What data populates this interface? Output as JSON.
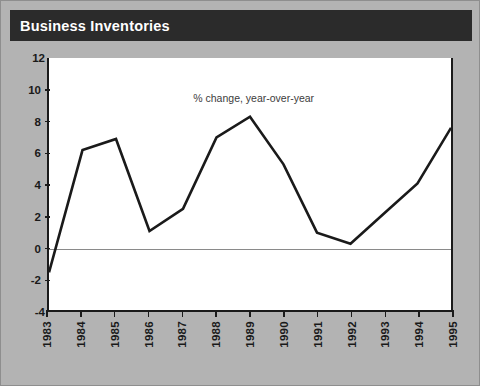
{
  "figure": {
    "background_color": "#b3b3b3",
    "plot_background_color": "#ffffff"
  },
  "header": {
    "title": "Business Inventories",
    "band_color": "#2b2b2b",
    "title_color": "#ffffff"
  },
  "chart_data": {
    "type": "line",
    "title": "Business Inventories",
    "annotation": "% change, year-over-year",
    "xlabel": "",
    "ylabel": "",
    "categories": [
      "1983",
      "1984",
      "1985",
      "1986",
      "1987",
      "1988",
      "1989",
      "1990",
      "1991",
      "1992",
      "1993",
      "1994",
      "1995"
    ],
    "x": [
      1983,
      1984,
      1985,
      1986,
      1987,
      1988,
      1989,
      1990,
      1991,
      1992,
      1993,
      1994,
      1995
    ],
    "values": [
      -1.5,
      6.2,
      6.9,
      1.1,
      2.5,
      7.0,
      8.3,
      5.3,
      1.0,
      0.3,
      2.2,
      4.1,
      7.6
    ],
    "series": [
      {
        "name": "% change, year-over-year",
        "values": [
          -1.5,
          6.2,
          6.9,
          1.1,
          2.5,
          7.0,
          8.3,
          5.3,
          1.0,
          0.3,
          2.2,
          4.1,
          7.6
        ],
        "color": "#1a1a1a",
        "line_width": 2.6
      }
    ],
    "ylim": [
      -4,
      12
    ],
    "xlim": [
      1983,
      1995
    ],
    "yticks": [
      -4,
      -2,
      0,
      2,
      4,
      6,
      8,
      10,
      12
    ],
    "ytick_labels": [
      "-4",
      "-2",
      "0",
      "2",
      "4",
      "6",
      "8",
      "10",
      "12"
    ],
    "xticks": [
      1983,
      1984,
      1985,
      1986,
      1987,
      1988,
      1989,
      1990,
      1991,
      1992,
      1993,
      1994,
      1995
    ],
    "grid": false,
    "zero_line": true,
    "zero_line_color": "#8a8a8a",
    "legend": "none",
    "axis_color": "#1a1a1a"
  }
}
